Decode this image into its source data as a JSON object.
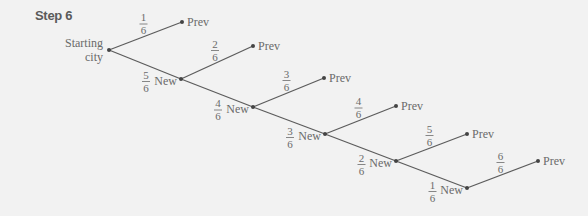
{
  "title": "Step 6",
  "start_label": [
    "Starting",
    "city"
  ],
  "colors": {
    "line": "#5c5c5c",
    "text": "#6a6a6a",
    "background": "#f2f2f2"
  },
  "nodes": [
    {
      "id": "start",
      "x": 109,
      "y": 50
    },
    {
      "id": "new1",
      "x": 181,
      "y": 79,
      "label": "New"
    },
    {
      "id": "new2",
      "x": 253,
      "y": 107,
      "label": "New"
    },
    {
      "id": "new3",
      "x": 325,
      "y": 134,
      "label": "New"
    },
    {
      "id": "new4",
      "x": 396,
      "y": 161,
      "label": "New"
    },
    {
      "id": "new5",
      "x": 467,
      "y": 188,
      "label": "New"
    }
  ],
  "prev_nodes": [
    {
      "x": 182,
      "y": 22,
      "label": "Prev"
    },
    {
      "x": 253,
      "y": 46,
      "label": "Prev"
    },
    {
      "x": 324,
      "y": 78,
      "label": "Prev"
    },
    {
      "x": 396,
      "y": 106,
      "label": "Prev"
    },
    {
      "x": 467,
      "y": 134,
      "label": "Prev"
    },
    {
      "x": 538,
      "y": 161,
      "label": "Prev"
    }
  ],
  "prev_probs": [
    {
      "num": "1",
      "den": "6"
    },
    {
      "num": "2",
      "den": "6"
    },
    {
      "num": "3",
      "den": "6"
    },
    {
      "num": "4",
      "den": "6"
    },
    {
      "num": "5",
      "den": "6"
    },
    {
      "num": "6",
      "den": "6"
    }
  ],
  "new_probs": [
    {
      "num": "5",
      "den": "6"
    },
    {
      "num": "4",
      "den": "6"
    },
    {
      "num": "3",
      "den": "6"
    },
    {
      "num": "2",
      "den": "6"
    },
    {
      "num": "1",
      "den": "6"
    }
  ]
}
